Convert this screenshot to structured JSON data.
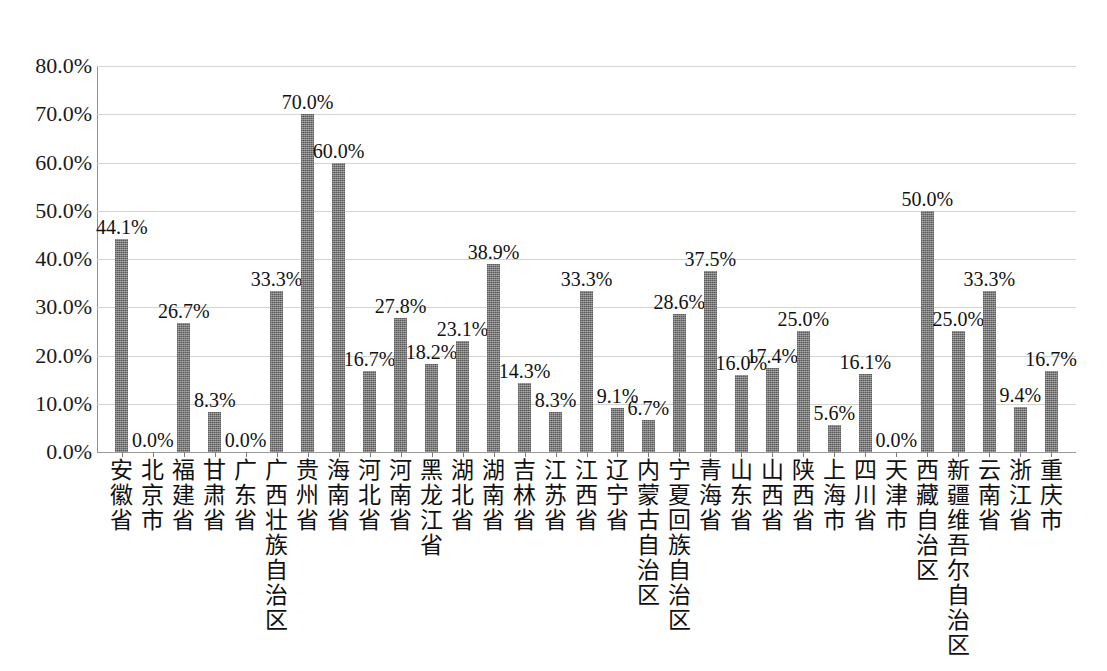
{
  "chart_data": {
    "type": "bar",
    "title": "",
    "xlabel": "",
    "ylabel": "",
    "ylim": [
      0,
      80
    ],
    "ytick_labels": [
      "80.0%",
      "70.0%",
      "60.0%",
      "50.0%",
      "40.0%",
      "30.0%",
      "20.0%",
      "10.0%",
      "0.0%"
    ],
    "ytick_values": [
      80,
      70,
      60,
      50,
      40,
      30,
      20,
      10,
      0
    ],
    "grid": true,
    "legend": "none",
    "bar_color": "#6e6e6e",
    "gridline_color": "#d4d4d4",
    "axis_color": "#8f8f8f",
    "categories": [
      "安徽省",
      "北京市",
      "福建省",
      "甘肃省",
      "广东省",
      "广西壮族自治区",
      "贵州省",
      "海南省",
      "河北省",
      "河南省",
      "黑龙江省",
      "湖北省",
      "湖南省",
      "吉林省",
      "江苏省",
      "江西省",
      "辽宁省",
      "内蒙古自治区",
      "宁夏回族自治区",
      "青海省",
      "山东省",
      "山西省",
      "陕西省",
      "上海市",
      "四川省",
      "天津市",
      "西藏自治区",
      "新疆维吾尔自治区",
      "云南省",
      "浙江省",
      "重庆市"
    ],
    "values": [
      44.1,
      0.0,
      26.7,
      8.3,
      0.0,
      33.3,
      70.0,
      60.0,
      16.7,
      27.8,
      18.2,
      23.1,
      38.9,
      14.3,
      8.3,
      33.3,
      9.1,
      6.7,
      28.6,
      37.5,
      16.0,
      17.4,
      25.0,
      5.6,
      16.1,
      0.0,
      50.0,
      25.0,
      33.3,
      9.4,
      16.7
    ],
    "data_labels": [
      "44.1%",
      "0.0%",
      "26.7%",
      "8.3%",
      "0.0%",
      "33.3%",
      "70.0%",
      "60.0%",
      "16.7%",
      "27.8%",
      "18.2%",
      "23.1%",
      "38.9%",
      "14.3%",
      "8.3%",
      "33.3%",
      "9.1%",
      "6.7%",
      "28.6%",
      "37.5%",
      "16.0%",
      "17.4%",
      "25.0%",
      "5.6%",
      "16.1%",
      "0.0%",
      "50.0%",
      "25.0%",
      "33.3%",
      "9.4%",
      "16.7%"
    ]
  },
  "caption": {
    "text": ""
  }
}
